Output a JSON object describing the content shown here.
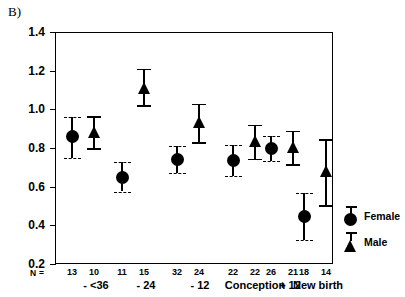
{
  "panel": {
    "label": "B)"
  },
  "chart_data": {
    "type": "scatter",
    "title": "",
    "xlabel": "",
    "ylabel": "Mean Sucks / Hr (ln) +SE",
    "ylim": [
      0.2,
      1.4
    ],
    "ytick_labels": [
      "1.4",
      "1.2",
      "1.0",
      "0.8",
      "0.6",
      "0.4",
      "0.2"
    ],
    "yticks": [
      1.4,
      1.2,
      1.0,
      0.8,
      0.6,
      0.4,
      0.2
    ],
    "grid": false,
    "legend_position": "right",
    "categories": [
      "- <36",
      "- 24",
      "- 12",
      "Conception",
      "+ 12",
      "New birth"
    ],
    "n_label": "N =",
    "series": [
      {
        "name": "Female",
        "marker": "circle",
        "values": [
          0.86,
          0.65,
          0.74,
          0.735,
          0.8,
          0.445
        ],
        "err_low": [
          0.75,
          0.575,
          0.67,
          0.655,
          0.735,
          0.325
        ],
        "err_high": [
          0.96,
          0.73,
          0.81,
          0.815,
          0.86,
          0.565
        ],
        "n": [
          13,
          11,
          32,
          22,
          26,
          18
        ]
      },
      {
        "name": "Male",
        "marker": "triangle",
        "values": [
          0.885,
          1.11,
          0.935,
          0.835,
          0.805,
          0.68
        ],
        "err_low": [
          0.8,
          1.02,
          0.83,
          0.745,
          0.715,
          0.505
        ],
        "err_high": [
          0.965,
          1.21,
          1.03,
          0.92,
          0.89,
          0.845
        ],
        "n": [
          10,
          15,
          24,
          22,
          21,
          14
        ]
      }
    ],
    "colors": {
      "marker": "#000000",
      "axis": "#000000",
      "background": "#ffffff"
    }
  },
  "legend": {
    "items": [
      {
        "label": "Female",
        "symbol": "filled-circle-with-errorbar"
      },
      {
        "label": "Male",
        "symbol": "filled-triangle-with-errorbar"
      }
    ]
  }
}
